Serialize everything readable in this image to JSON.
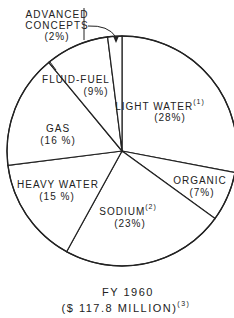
{
  "chart_data": {
    "type": "pie",
    "title": "FY 1960",
    "subtitle": "($ 117.8 MILLION)",
    "subtitle_footnote": "(3)",
    "start": "top",
    "direction": "clockwise",
    "slices": [
      {
        "label": "LIGHT WATER",
        "footnote": "(1)",
        "pct_text": "(28%)",
        "value": 28
      },
      {
        "label": "ORGANIC",
        "footnote": "",
        "pct_text": "(7%)",
        "value": 7
      },
      {
        "label": "SODIUM",
        "footnote": "(2)",
        "pct_text": "(23%)",
        "value": 23
      },
      {
        "label": "HEAVY WATER",
        "footnote": "",
        "pct_text": "(15 %)",
        "value": 15
      },
      {
        "label": "GAS",
        "footnote": "",
        "pct_text": "(16 %)",
        "value": 16
      },
      {
        "label": "FLUID-FUEL",
        "footnote": "",
        "pct_text": "(9%)",
        "value": 9
      },
      {
        "label": "ADVANCED CONCEPTS",
        "footnote": "",
        "pct_text": "(2%)",
        "value": 2
      }
    ],
    "callout": {
      "label_line1": "ADVANCED",
      "label_line2": "CONCEPTS",
      "pct_text": "(2%)"
    }
  }
}
